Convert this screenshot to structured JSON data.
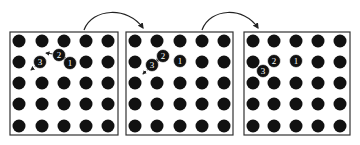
{
  "figure": {
    "panels": [
      {
        "id": "panel-1",
        "box": {
          "x": 10,
          "y": 32,
          "w": 108,
          "h": 103
        },
        "lattice": {
          "cols": [
            19,
            42,
            64,
            86,
            108
          ],
          "rows": [
            41,
            62,
            83,
            104,
            126
          ],
          "radius": 6.5
        },
        "labeled_atoms": [
          {
            "label": "1",
            "x": 70,
            "y": 63
          },
          {
            "label": "2",
            "x": 59,
            "y": 55
          },
          {
            "label": "3",
            "x": 40,
            "y": 62
          }
        ],
        "hidden_sites": [
          [
            64,
            62
          ],
          [
            42,
            62
          ]
        ],
        "motion_arrows": [
          {
            "from": [
              53,
              54
            ],
            "to": [
              46,
              53
            ],
            "style": "solid"
          },
          {
            "from": [
              66,
              59
            ],
            "to": [
              62,
              58
            ],
            "style": "solid"
          },
          {
            "from": [
              36,
              66
            ],
            "to": [
              31,
              70
            ],
            "style": "dotted"
          }
        ]
      },
      {
        "id": "panel-2",
        "box": {
          "x": 126,
          "y": 32,
          "w": 107,
          "h": 103
        },
        "lattice": {
          "cols": [
            135,
            157,
            180,
            202,
            224
          ],
          "rows": [
            41,
            62,
            83,
            104,
            126
          ],
          "radius": 6.5
        },
        "labeled_atoms": [
          {
            "label": "1",
            "x": 180,
            "y": 61
          },
          {
            "label": "2",
            "x": 163,
            "y": 56
          },
          {
            "label": "3",
            "x": 152,
            "y": 65
          }
        ],
        "hidden_sites": [
          [
            157,
            62
          ],
          [
            180,
            62
          ]
        ],
        "motion_arrows": [
          {
            "from": [
              158,
              60
            ],
            "to": [
              156,
              62
            ],
            "style": "dotted"
          },
          {
            "from": [
              148,
              69
            ],
            "to": [
              143,
              74
            ],
            "style": "dotted"
          }
        ]
      },
      {
        "id": "panel-3",
        "box": {
          "x": 244,
          "y": 32,
          "w": 106,
          "h": 103
        },
        "lattice": {
          "cols": [
            253,
            274,
            296,
            318,
            340
          ],
          "rows": [
            41,
            62,
            83,
            104,
            126
          ],
          "radius": 6.5
        },
        "labeled_atoms": [
          {
            "label": "1",
            "x": 296,
            "y": 61
          },
          {
            "label": "2",
            "x": 274,
            "y": 61
          },
          {
            "label": "3",
            "x": 263,
            "y": 71
          }
        ],
        "hidden_sites": [
          [
            274,
            62
          ],
          [
            296,
            62
          ]
        ],
        "motion_arrows": []
      }
    ],
    "transition_arrows": [
      {
        "id": "arrow-1-to-2",
        "path": "M84 30 C 92 8, 128 6, 143 28",
        "head": [
          143,
          30
        ]
      },
      {
        "id": "arrow-2-to-3",
        "path": "M202 30 C 210 8, 244 6, 258 28",
        "head": [
          258,
          30
        ]
      }
    ],
    "colors": {
      "atom": "#111111",
      "label": "#ffffff",
      "border": "#333333",
      "arrow": "#222222",
      "background": "#ffffff"
    }
  }
}
